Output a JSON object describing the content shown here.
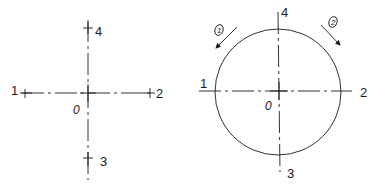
{
  "diagram": {
    "left": {
      "title": "axis-cross",
      "origin_label": "0",
      "points": [
        {
          "id": "1",
          "label": "1"
        },
        {
          "id": "2",
          "label": "2"
        },
        {
          "id": "3",
          "label": "3"
        },
        {
          "id": "4",
          "label": "4"
        }
      ]
    },
    "right": {
      "title": "circle-with-axes",
      "origin_label": "0",
      "points": [
        {
          "id": "1",
          "label": "1"
        },
        {
          "id": "2",
          "label": "2"
        },
        {
          "id": "3",
          "label": "3"
        },
        {
          "id": "4",
          "label": "4"
        }
      ],
      "arrows": [
        {
          "id": "arrow-1",
          "label": "1",
          "direction": "down-left"
        },
        {
          "id": "arrow-2",
          "label": "2",
          "direction": "down-right"
        }
      ]
    }
  }
}
